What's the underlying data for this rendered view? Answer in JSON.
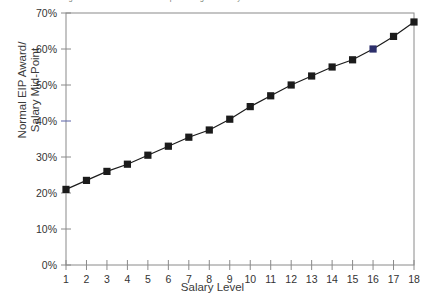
{
  "chart_data": {
    "type": "line",
    "title": "Figure: Normal EIP Award as a percentage of Salary Mid-Point",
    "xlabel": "Salary Level",
    "ylabel_line1": "Normal EIP Award/",
    "ylabel_line2": "Salary Mid-Point",
    "x": [
      1,
      2,
      3,
      4,
      5,
      6,
      7,
      8,
      9,
      10,
      11,
      12,
      13,
      14,
      15,
      16,
      17,
      18
    ],
    "categories": [
      "1",
      "2",
      "3",
      "4",
      "5",
      "6",
      "7",
      "8",
      "9",
      "10",
      "11",
      "12",
      "13",
      "14",
      "15",
      "16",
      "17",
      "18"
    ],
    "values": [
      21,
      23.5,
      26,
      28,
      30.5,
      33,
      35.5,
      37.5,
      40.5,
      44,
      47,
      50,
      52.5,
      55,
      57,
      60,
      63.5,
      67.5
    ],
    "ylim": [
      0,
      70
    ],
    "ytick_labels": [
      "0%",
      "10%",
      "20%",
      "30%",
      "40%",
      "50%",
      "60%",
      "70%"
    ],
    "ytick_values": [
      0,
      10,
      20,
      30,
      40,
      50,
      60,
      70
    ],
    "xlim": [
      1,
      18
    ],
    "grid": false,
    "legend": "none",
    "marker": "square",
    "series_color": "#1b1b1b",
    "highlight_point_index": 15,
    "highlight_color": "#2d2f6b",
    "axis_color": "#8a8a8a",
    "plot_background": "#ffffff"
  }
}
